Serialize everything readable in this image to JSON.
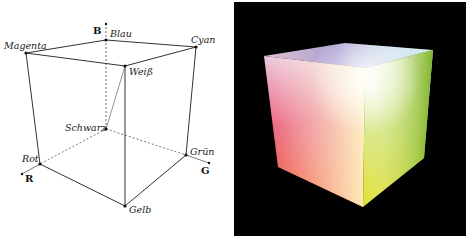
{
  "diagram": {
    "axes": [
      {
        "name": "R",
        "label": "R"
      },
      {
        "name": "G",
        "label": "G"
      },
      {
        "name": "B",
        "label": "B"
      }
    ],
    "vertices": {
      "black": "Schwarz",
      "red": "Rot",
      "green": "Grün",
      "blue": "Blau",
      "yellow": "Gelb",
      "cyan": "Cyan",
      "magenta": "Magenta",
      "white": "Weiß"
    }
  },
  "render": {
    "title": "Rendered RGB color cube",
    "background": "#000000",
    "colors": {
      "white": "#ffffff",
      "red": "#ff3a2a",
      "yellow": "#ffe02a",
      "green": "#7dbb22",
      "magenta": "#e8a0c8",
      "cyan": "#d6eef0",
      "blue": "#5a5aa8"
    }
  }
}
